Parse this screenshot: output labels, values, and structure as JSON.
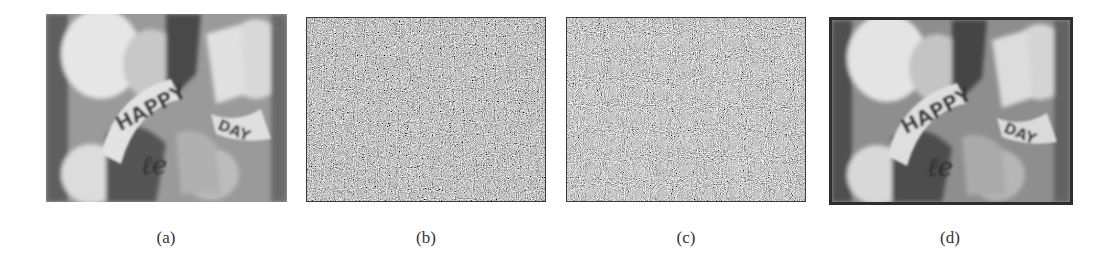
{
  "figure": {
    "panels": [
      {
        "id": "a",
        "label": "(a)",
        "content": "original grayscale image",
        "banner_text": [
          "HAPPY",
          "DAY"
        ]
      },
      {
        "id": "b",
        "label": "(b)",
        "content": "noise-like encrypted image"
      },
      {
        "id": "c",
        "label": "(c)",
        "content": "noise-like encrypted image"
      },
      {
        "id": "d",
        "label": "(d)",
        "content": "decrypted grayscale image",
        "banner_text": [
          "HAPPY",
          "DAY"
        ]
      }
    ]
  },
  "colors": {
    "background": "#ffffff",
    "label": "#333333",
    "border": "#3a3a3a"
  }
}
